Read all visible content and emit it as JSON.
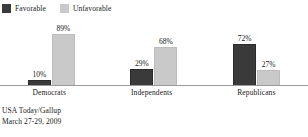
{
  "chart_data": {
    "type": "bar",
    "title": "",
    "subtitle": "",
    "xlabel": "",
    "ylabel": "",
    "ylim": [
      0,
      100
    ],
    "grid": false,
    "legend_position": "top-left",
    "categories": [
      "Democrats",
      "Independents",
      "Republicans"
    ],
    "series": [
      {
        "name": "Favorable",
        "color": "#3a3a3a",
        "values": [
          10,
          29,
          72
        ],
        "value_labels": [
          "10%",
          "29%",
          "72%"
        ]
      },
      {
        "name": "Unfavorable",
        "color": "#c9c9c9",
        "values": [
          89,
          68,
          27
        ],
        "value_labels": [
          "89%",
          "68%",
          "27%"
        ]
      }
    ],
    "source_lines": [
      "USA Today/Gallup",
      "March 27-29, 2009"
    ]
  },
  "legend": {
    "items": [
      {
        "label": "Favorable",
        "swatch_color": "#3a3a3a",
        "swatch_icon": "legend-swatch-dark"
      },
      {
        "label": "Unfavorable",
        "swatch_color": "#c9c9c9",
        "swatch_icon": "legend-swatch-light"
      }
    ]
  },
  "source": {
    "line1": "USA Today/Gallup",
    "line2": "March 27-29, 2009"
  }
}
